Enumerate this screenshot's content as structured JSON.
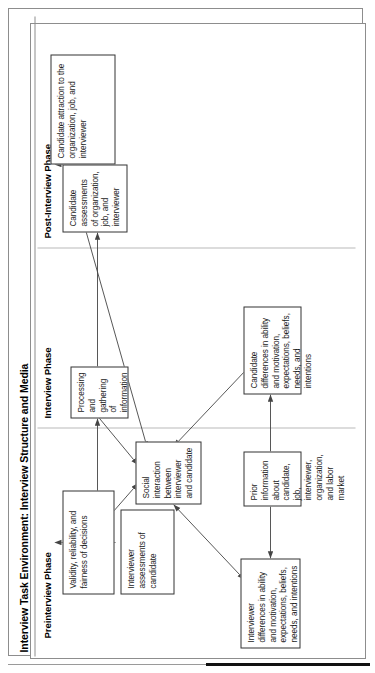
{
  "figure": {
    "title": "Interview Task Environment: Interview Structure and Media",
    "phases": [
      {
        "id": "preinterview",
        "label": "Preinterview Phase"
      },
      {
        "id": "interview",
        "label": "Interview Phase"
      },
      {
        "id": "postinterview",
        "label": "Post-Interview Phase"
      }
    ],
    "nodes": [
      {
        "id": "interviewer-differences",
        "text": "Interviewer differences in ability and motivation, expectations, beliefs, needs, and intentions"
      },
      {
        "id": "prior-information",
        "text": "Prior information about candidate, job, interviewer, organization, and labor market"
      },
      {
        "id": "candidate-differences",
        "text": "Candidate differences in ability and motivation, expectations, beliefs, needs, and intentions"
      },
      {
        "id": "social-interaction",
        "text": "Social interaction between interviewer and candidate"
      },
      {
        "id": "interviewer-assessments",
        "text": "Interviewer assessments of candidate"
      },
      {
        "id": "processing-gathering",
        "text": "Processing and gathering of information"
      },
      {
        "id": "candidate-assessments",
        "text": "Candidate assessments of organization, job, and interviewer"
      },
      {
        "id": "validity-reliability",
        "text": "Validity, reliability, and fairness of decisions"
      },
      {
        "id": "candidate-attraction",
        "text": "Candidate attraction to the organization, job, and interviewer"
      }
    ],
    "edges": [
      {
        "from": "prior-information",
        "to": "interviewer-differences",
        "style": "single"
      },
      {
        "from": "prior-information",
        "to": "candidate-differences",
        "style": "single"
      },
      {
        "from": "interviewer-differences",
        "to": "social-interaction",
        "style": "double"
      },
      {
        "from": "candidate-differences",
        "to": "social-interaction",
        "style": "double"
      },
      {
        "from": "social-interaction",
        "to": "interviewer-assessments",
        "style": "double"
      },
      {
        "from": "social-interaction",
        "to": "processing-gathering",
        "style": "double"
      },
      {
        "from": "social-interaction",
        "to": "candidate-assessments",
        "style": "double"
      },
      {
        "from": "interviewer-assessments",
        "to": "processing-gathering",
        "style": "double"
      },
      {
        "from": "processing-gathering",
        "to": "candidate-assessments",
        "style": "double"
      },
      {
        "from": "interviewer-assessments",
        "to": "validity-reliability",
        "style": "single"
      },
      {
        "from": "candidate-assessments",
        "to": "candidate-attraction",
        "style": "single"
      }
    ],
    "colors": {
      "frame": "#8d8d8d",
      "node_border": "#333333",
      "arrow": "#444444",
      "text": "#000000",
      "rule_dark": "#111111"
    }
  }
}
